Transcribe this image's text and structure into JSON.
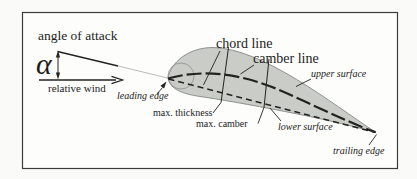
{
  "figure": {
    "type": "airfoil-terminology-diagram",
    "labels": {
      "angle_of_attack": "angle of attack",
      "alpha": "α",
      "relative_wind": "relative wind",
      "chord_line": "chord line",
      "camber_line": "camber line",
      "leading_edge": "leading edge",
      "max_thickness": "max. thickness",
      "max_camber": "max. camber",
      "upper_surface": "upper surface",
      "lower_surface": "lower surface",
      "trailing_edge": "trailing edge"
    },
    "colors": {
      "background": "#fafaf8",
      "frame_fill": "#fdfdfc",
      "frame_border": "#3c3c3a",
      "airfoil_fill": "#c9ccc7",
      "airfoil_outline": "#8f918d",
      "line_dark": "#22221f",
      "extension_line": "#b3b3af",
      "text_color": "#1c1c1a"
    }
  }
}
